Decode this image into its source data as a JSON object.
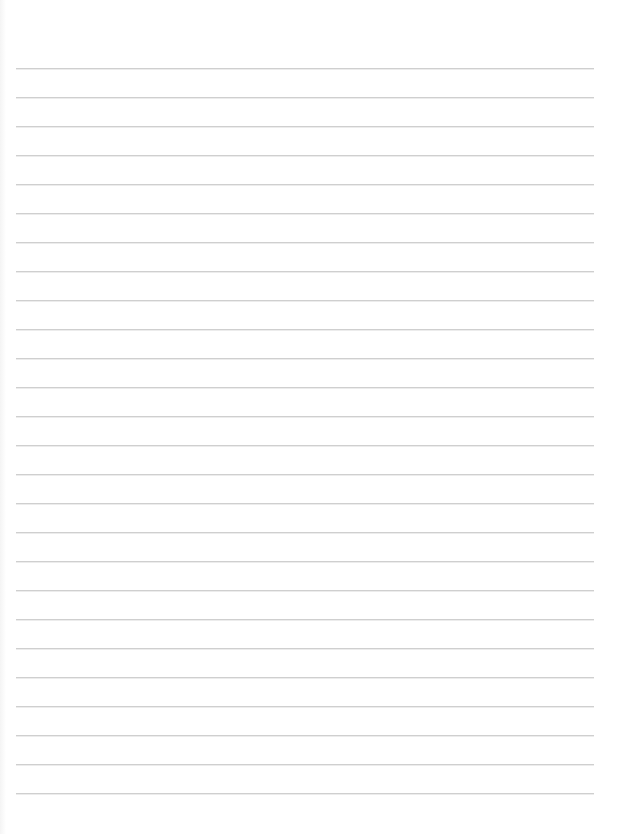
{
  "page": {
    "type": "blank-lined-paper",
    "background_color": "#ffffff",
    "line_color": "#cfcfcf",
    "line_count": 26,
    "first_line_y": 68,
    "line_spacing": 29,
    "line_left": 16,
    "line_right": 594
  }
}
